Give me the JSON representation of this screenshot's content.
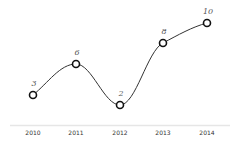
{
  "chart_data": {
    "type": "line",
    "title": "",
    "xlabel": "",
    "ylabel": "",
    "categories": [
      "2010",
      "2011",
      "2012",
      "2013",
      "2014"
    ],
    "values": [
      3,
      6,
      2,
      8,
      10
    ],
    "data_labels": [
      "3",
      "6",
      "2",
      "8",
      "10"
    ],
    "ylim": [
      0,
      12
    ],
    "grid": false,
    "legend": "none",
    "smooth": true,
    "markers": "hollow-circle",
    "colors": {
      "line": "#333333",
      "marker_stroke": "#111111",
      "axis": "#e6e6e6"
    }
  }
}
